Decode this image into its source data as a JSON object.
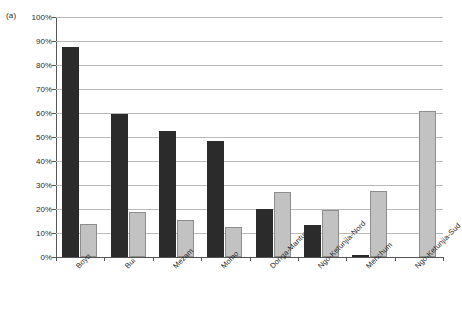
{
  "panel": {
    "letter": "(a)"
  },
  "chart_data": {
    "type": "bar",
    "title": "",
    "subtitle": "",
    "xlabel": "",
    "ylabel": "",
    "ylim": [
      0,
      100
    ],
    "yunit": "%",
    "grid": true,
    "legend": "none",
    "orientation": "vertical",
    "grouping": "grouped",
    "categories": [
      "Boyo",
      "Bui",
      "Mezam",
      "Momo",
      "Donga-Mantung",
      "Ngo-Ketunjia-Nord",
      "Menchum",
      "Ngo-Ketunjia-Sud"
    ],
    "ticklabels_y": [
      "0%",
      "10%",
      "20%",
      "30%",
      "40%",
      "50%",
      "60%",
      "70%",
      "80%",
      "90%",
      "100%"
    ],
    "tickvalues_y": [
      0,
      10,
      20,
      30,
      40,
      50,
      60,
      70,
      80,
      90,
      100
    ],
    "series": [
      {
        "name": "series-dark",
        "color": "#2b2b2b",
        "values": [
          87.5,
          59.7,
          52.5,
          48.5,
          19.8,
          13.5,
          1.0,
          0.0
        ]
      },
      {
        "name": "series-light",
        "color": "#c2c2c2",
        "values": [
          13.7,
          18.6,
          15.5,
          12.5,
          27.0,
          19.5,
          27.5,
          61.0
        ]
      }
    ],
    "colors": {
      "dark_bar": "#2b2b2b",
      "light_bar": "#c2c2c2",
      "light_bar_border": "#8d8d8d",
      "gridline": "#b9b9b9",
      "axis": "#555555",
      "text": "#2b2b2b",
      "background": "#ffffff"
    }
  }
}
